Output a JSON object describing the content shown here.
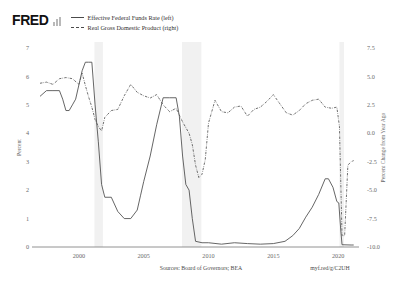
{
  "brand": {
    "logo_text": "FRED",
    "logo_icon": "bar-chart-icon"
  },
  "legend": {
    "position": "top-left",
    "items": [
      {
        "label": "Effective Federal Funds Rate (left)",
        "style": "solid",
        "axis": "left"
      },
      {
        "label": "Real Gross Domestic Product (right)",
        "style": "dash-dot",
        "axis": "right"
      }
    ]
  },
  "footer": {
    "sources": "Sources: Board of Governors; BEA",
    "permalink": "myf.red/g/C2UH"
  },
  "chart_data": {
    "type": "line",
    "title": "",
    "subtitle": "",
    "xlabel": "",
    "ylabel": "Percent",
    "y2label": "Percent Change from Year Ago",
    "xlim": [
      1997.0,
      2021.3
    ],
    "ylim": [
      0,
      7
    ],
    "y2lim": [
      -10.0,
      7.5
    ],
    "grid": false,
    "legend_position": "top-left",
    "x_ticks": [
      2000,
      2005,
      2010,
      2015,
      2020
    ],
    "x_tick_labels": [
      "2000",
      "2005",
      "2010",
      "2015",
      "2020"
    ],
    "y_ticks": [
      0,
      1,
      2,
      3,
      4,
      5,
      6,
      7
    ],
    "y_tick_labels": [
      "0",
      "1",
      "2",
      "3",
      "4",
      "5",
      "6",
      "7"
    ],
    "y2_ticks": [
      -10.0,
      -7.5,
      -5.0,
      -2.5,
      0.0,
      2.5,
      5.0,
      7.5
    ],
    "y2_tick_labels": [
      "-10.0",
      "-7.5",
      "-5.0",
      "-2.5",
      "0.0",
      "2.5",
      "5.0",
      "7.5"
    ],
    "recession_bands": [
      {
        "start": 2001.2,
        "end": 2001.85
      },
      {
        "start": 2007.95,
        "end": 2009.45
      },
      {
        "start": 2020.1,
        "end": 2020.45
      }
    ],
    "series": [
      {
        "name": "Effective Federal Funds Rate (left)",
        "axis": "left",
        "style": "solid",
        "color": "#4a4a4a",
        "x": [
          1997.0,
          1997.5,
          1998.0,
          1998.5,
          1998.75,
          1999.0,
          1999.25,
          1999.5,
          1999.75,
          2000.0,
          2000.25,
          2000.5,
          2000.75,
          2001.0,
          2001.25,
          2001.5,
          2001.75,
          2002.0,
          2002.5,
          2003.0,
          2003.5,
          2004.0,
          2004.5,
          2004.75,
          2005.0,
          2005.5,
          2006.0,
          2006.5,
          2007.0,
          2007.5,
          2007.75,
          2008.0,
          2008.25,
          2008.5,
          2008.75,
          2009.0,
          2009.5,
          2010.0,
          2011.0,
          2012.0,
          2013.0,
          2014.0,
          2015.0,
          2015.9,
          2016.5,
          2017.0,
          2017.5,
          2018.0,
          2018.5,
          2019.0,
          2019.25,
          2019.6,
          2019.9,
          2020.05,
          2020.2,
          2020.3,
          2021.0,
          2021.2
        ],
        "values": [
          5.3,
          5.5,
          5.5,
          5.5,
          5.2,
          4.8,
          4.8,
          5.0,
          5.2,
          5.7,
          6.2,
          6.5,
          6.5,
          6.5,
          5.0,
          3.7,
          2.2,
          1.75,
          1.75,
          1.25,
          1.0,
          1.0,
          1.3,
          1.8,
          2.3,
          3.2,
          4.3,
          5.25,
          5.25,
          5.25,
          4.6,
          3.2,
          2.2,
          2.0,
          1.0,
          0.2,
          0.15,
          0.15,
          0.1,
          0.15,
          0.12,
          0.1,
          0.12,
          0.2,
          0.4,
          0.65,
          1.05,
          1.4,
          1.85,
          2.4,
          2.4,
          2.1,
          1.6,
          1.55,
          0.6,
          0.08,
          0.07,
          0.07
        ],
        "peak": 6.5,
        "trough": 0.07
      },
      {
        "name": "Real Gross Domestic Product (right)",
        "axis": "right",
        "style": "dash-dot",
        "color": "#555555",
        "x": [
          1997.0,
          1997.5,
          1998.0,
          1998.5,
          1999.0,
          1999.5,
          2000.0,
          2000.25,
          2000.5,
          2000.75,
          2001.0,
          2001.25,
          2001.5,
          2001.75,
          2002.0,
          2002.5,
          2003.0,
          2003.5,
          2004.0,
          2004.5,
          2005.0,
          2005.5,
          2006.0,
          2006.5,
          2007.0,
          2007.5,
          2008.0,
          2008.5,
          2008.75,
          2009.0,
          2009.25,
          2009.5,
          2009.75,
          2010.0,
          2010.5,
          2011.0,
          2011.5,
          2012.0,
          2012.5,
          2013.0,
          2013.5,
          2014.0,
          2014.5,
          2015.0,
          2015.5,
          2016.0,
          2016.5,
          2017.0,
          2017.5,
          2018.0,
          2018.5,
          2019.0,
          2019.5,
          2019.9,
          2020.1,
          2020.3,
          2020.5,
          2020.75,
          2021.0,
          2021.2
        ],
        "values": [
          4.4,
          4.5,
          4.3,
          4.8,
          4.9,
          4.8,
          4.3,
          5.3,
          4.2,
          3.2,
          2.3,
          1.2,
          0.6,
          0.2,
          1.4,
          2.0,
          2.1,
          3.3,
          4.3,
          3.6,
          3.3,
          3.1,
          3.4,
          2.5,
          1.9,
          2.2,
          1.0,
          0.0,
          -1.0,
          -2.8,
          -3.9,
          -3.6,
          -2.3,
          0.9,
          2.9,
          1.9,
          1.8,
          2.3,
          2.4,
          1.5,
          2.1,
          2.3,
          2.8,
          3.4,
          2.6,
          1.8,
          1.6,
          2.0,
          2.6,
          2.9,
          3.0,
          2.3,
          2.2,
          2.3,
          0.6,
          -9.0,
          -9.0,
          -2.8,
          -2.5,
          -2.4
        ],
        "peak": 5.3,
        "trough": -9.0
      }
    ]
  }
}
